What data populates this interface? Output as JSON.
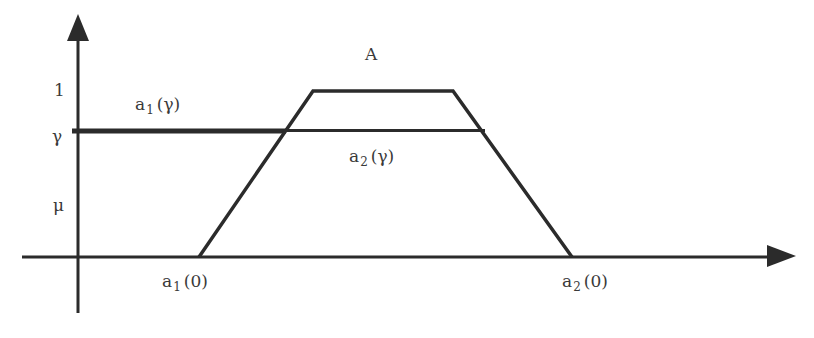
{
  "diagram": {
    "title_label": "A",
    "y_axis": {
      "label": "μ",
      "tick_1": "1",
      "tick_gamma": "γ"
    },
    "labels": {
      "a1_gamma": {
        "base": "a",
        "sub": "1",
        "arg": "(γ)"
      },
      "a2_gamma": {
        "base": "a",
        "sub": "2",
        "arg": "(γ)"
      },
      "a1_zero": {
        "base": "a",
        "sub": "1",
        "arg": "(0)"
      },
      "a2_zero": {
        "base": "a",
        "sub": "2",
        "arg": "(0)"
      }
    },
    "shape": {
      "type": "trapezoidal fuzzy number",
      "points": [
        [
          199,
          257
        ],
        [
          313,
          91
        ],
        [
          453,
          91
        ],
        [
          572,
          257
        ]
      ]
    },
    "colors": {
      "line": "#2b2b2b",
      "text": "#3a3a3a",
      "background": "#ffffff"
    }
  }
}
